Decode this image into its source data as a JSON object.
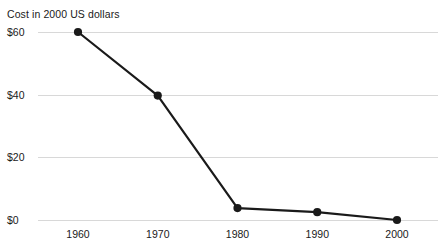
{
  "chart_data": {
    "type": "line",
    "title": "Cost in 2000 US dollars",
    "xlabel": "",
    "ylabel": "",
    "grid": true,
    "legend": false,
    "categories": [
      "1960",
      "1970",
      "1980",
      "1990",
      "2000"
    ],
    "x": [
      1960,
      1970,
      1980,
      1990,
      2000
    ],
    "values": [
      60,
      39.7,
      3.8,
      2.5,
      0
    ],
    "series": [
      {
        "name": "Cost",
        "values": [
          60,
          39.7,
          3.8,
          2.5,
          0
        ]
      }
    ],
    "xlim": [
      1960,
      2000
    ],
    "ylim": [
      0,
      60
    ],
    "y_ticks": [
      0,
      20,
      40,
      60
    ],
    "y_tick_labels": [
      "$0",
      "$20",
      "$40",
      "$60"
    ],
    "x_ticks": [
      1960,
      1970,
      1980,
      1990,
      2000
    ],
    "x_tick_labels": [
      "1960",
      "1970",
      "1980",
      "1990",
      "2000"
    ],
    "line_color": "#1a1a1a",
    "marker_color": "#1a1a1a",
    "gridline_color": "#d8d8d8",
    "background_color": "#ffffff"
  },
  "layout": {
    "plot_left": 38,
    "plot_right": 438,
    "y_top_px": 32,
    "y_bottom_px": 220,
    "x_first_px": 78,
    "x_step_px": 79.75
  }
}
